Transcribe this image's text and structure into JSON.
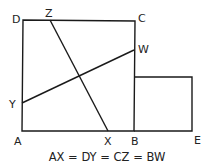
{
  "diagram": {
    "points": {
      "A": {
        "label": "A",
        "x": 22,
        "y": 131
      },
      "B": {
        "label": "B",
        "x": 134,
        "y": 131
      },
      "C": {
        "label": "C",
        "x": 135,
        "y": 21
      },
      "D": {
        "label": "D",
        "x": 23,
        "y": 20
      },
      "E": {
        "label": "E",
        "x": 192,
        "y": 131
      },
      "X": {
        "label": "X",
        "x": 108,
        "y": 131
      },
      "Y": {
        "label": "Y",
        "x": 22,
        "y": 103
      },
      "Z": {
        "label": "Z",
        "x": 50,
        "y": 20
      },
      "W": {
        "label": "W",
        "x": 134,
        "y": 50
      }
    },
    "shapes": [
      {
        "name": "large-square",
        "vertices": [
          "A",
          "B",
          "C",
          "D"
        ]
      },
      {
        "name": "small-square",
        "vertices": [
          "B",
          "E",
          "top-right",
          "top-left"
        ],
        "top_y": 77
      }
    ],
    "segments": [
      {
        "name": "segment-ZX",
        "from": "Z",
        "to": "X"
      },
      {
        "name": "segment-YW",
        "from": "Y",
        "to": "W"
      }
    ],
    "caption": "AX = DY = CZ = BW",
    "line_color": "#1a1a1a"
  }
}
